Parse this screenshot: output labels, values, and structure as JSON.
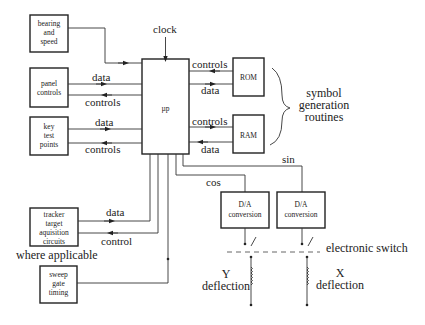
{
  "diagram": {
    "blocks": {
      "bearing": [
        "bearing",
        "and",
        "speed"
      ],
      "panel": [
        "panel",
        "controls"
      ],
      "key": [
        "key",
        "test",
        "points"
      ],
      "tracker": [
        "tracker",
        "target",
        "aquisition",
        "circuits"
      ],
      "sweep": [
        "sweep",
        "gate",
        "timing"
      ],
      "up": "µp",
      "rom": "ROM",
      "ram": "RAM",
      "da1": [
        "D/A",
        "conversion"
      ],
      "da2": [
        "D/A",
        "conversion"
      ]
    },
    "labels": {
      "clock": "clock",
      "panel_data": "data",
      "panel_controls": "controls",
      "key_data": "data",
      "key_controls": "controls",
      "rom_controls": "controls",
      "rom_data": "data",
      "ram_controls": "controls",
      "ram_data": "data",
      "tracker_data": "data",
      "tracker_control": "control",
      "where_applicable": "where applicable",
      "cos": "cos",
      "sin": "sin",
      "electronic_switch": "electronic switch",
      "y_deflection": [
        "Y",
        "deflection"
      ],
      "x_deflection": [
        "X",
        "deflection"
      ],
      "symbol_generation": [
        "symbol",
        "generation",
        "routines"
      ]
    }
  }
}
